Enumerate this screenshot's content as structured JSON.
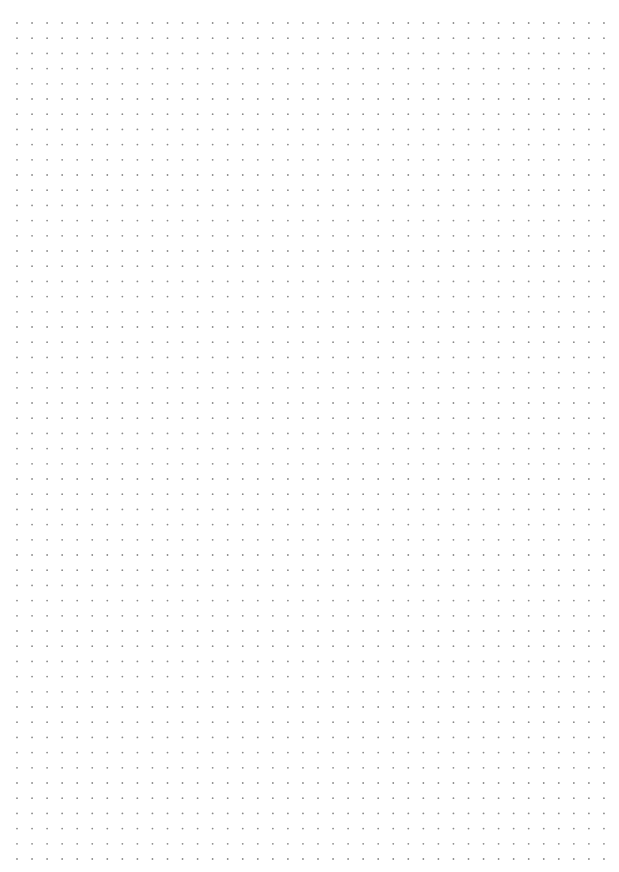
{
  "page": {
    "type": "dot-grid-paper",
    "background_color": "#ffffff",
    "dot_color": "#8a8a8a",
    "dot_radius": 0.9,
    "origin_x": 17,
    "origin_y": 23,
    "spacing_x": 15.05,
    "spacing_y": 15.2,
    "columns": 40,
    "rows": 56
  }
}
